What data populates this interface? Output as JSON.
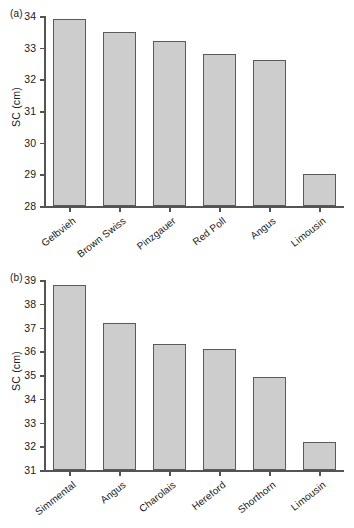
{
  "figure": {
    "width": 354,
    "height": 528,
    "background": "#ffffff",
    "bar_fill": "#cdcdcd",
    "bar_stroke": "#5a5a5a",
    "axis_color": "#545454"
  },
  "panels": [
    {
      "id": "a",
      "panel_label": "(a)",
      "ylabel": "SC (cm)",
      "ylim": [
        28,
        34
      ],
      "yticks": [
        28,
        29,
        30,
        31,
        32,
        33,
        34
      ],
      "ytick_labels": [
        "28",
        "29",
        "30",
        "31",
        "32",
        "33",
        "34"
      ],
      "categories": [
        "Gelbvieh",
        "Brown Swiss",
        "Pinzgauer",
        "Red Poll",
        "Angus",
        "Limousin"
      ],
      "values": [
        33.9,
        33.5,
        33.2,
        32.8,
        32.6,
        29.0
      ]
    },
    {
      "id": "b",
      "panel_label": "(b)",
      "ylabel": "SC (cm)",
      "ylim": [
        31,
        39
      ],
      "yticks": [
        31,
        32,
        33,
        34,
        35,
        36,
        37,
        38,
        39
      ],
      "ytick_labels": [
        "31",
        "32",
        "33",
        "34",
        "35",
        "36",
        "37",
        "38",
        "39"
      ],
      "categories": [
        "Simmental",
        "Angus",
        "Charolais",
        "Hereford",
        "Shorthorn",
        "Limousin"
      ],
      "values": [
        38.8,
        37.2,
        36.3,
        36.1,
        34.9,
        32.2
      ]
    }
  ],
  "chart_data": [
    {
      "type": "bar",
      "title": "(a)",
      "xlabel": "",
      "ylabel": "SC (cm)",
      "categories": [
        "Gelbvieh",
        "Brown Swiss",
        "Pinzgauer",
        "Red Poll",
        "Angus",
        "Limousin"
      ],
      "values": [
        33.9,
        33.5,
        33.2,
        32.8,
        32.6,
        29.0
      ],
      "ylim": [
        28,
        34
      ],
      "yticks": [
        28,
        29,
        30,
        31,
        32,
        33,
        34
      ],
      "grid": false,
      "legend": "none"
    },
    {
      "type": "bar",
      "title": "(b)",
      "xlabel": "",
      "ylabel": "SC (cm)",
      "categories": [
        "Simmental",
        "Angus",
        "Charolais",
        "Hereford",
        "Shorthorn",
        "Limousin"
      ],
      "values": [
        38.8,
        37.2,
        36.3,
        36.1,
        34.9,
        32.2
      ],
      "ylim": [
        31,
        39
      ],
      "yticks": [
        31,
        32,
        33,
        34,
        35,
        36,
        37,
        38,
        39
      ],
      "grid": false,
      "legend": "none"
    }
  ]
}
